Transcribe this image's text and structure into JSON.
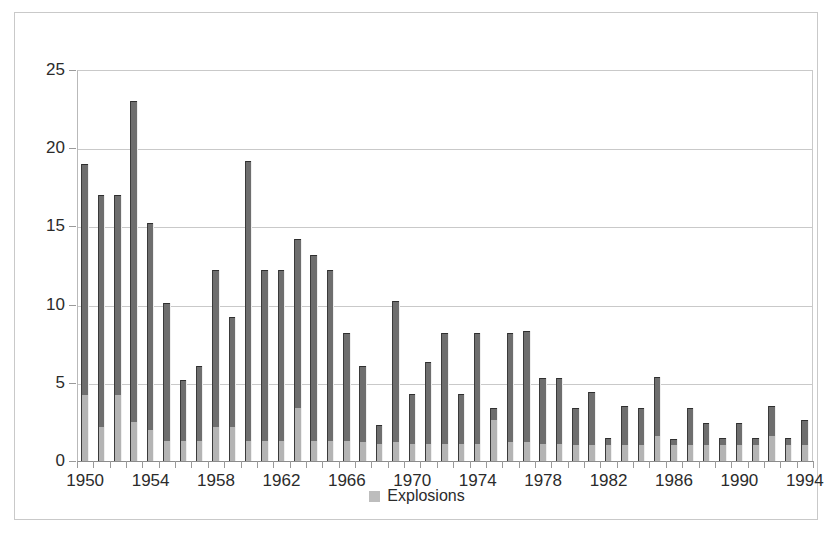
{
  "chart_data": {
    "type": "bar",
    "title": "",
    "xlabel": "",
    "ylabel": "",
    "ylim": [
      0,
      25
    ],
    "ytick_values": [
      0,
      5,
      10,
      15,
      20,
      25
    ],
    "ytick_labels": [
      "0",
      "5",
      "10",
      "15",
      "20",
      "25"
    ],
    "grid": true,
    "legend_position": "bottom",
    "legend": [
      {
        "name": "Explosions",
        "color": "#bdbdbd"
      }
    ],
    "series_colors": {
      "base_segment": "#b4b4b4",
      "upper_segment": "#6e6e6e"
    },
    "categories": [
      "1950",
      "1951",
      "1952",
      "1953",
      "1954",
      "1955",
      "1956",
      "1957",
      "1958",
      "1959",
      "1960",
      "1961",
      "1962",
      "1963",
      "1964",
      "1965",
      "1966",
      "1967",
      "1968",
      "1969",
      "1970",
      "1971",
      "1972",
      "1973",
      "1974",
      "1975",
      "1976",
      "1977",
      "1978",
      "1979",
      "1980",
      "1981",
      "1982",
      "1983",
      "1984",
      "1985",
      "1986",
      "1987",
      "1988",
      "1989",
      "1990",
      "1991",
      "1992",
      "1993",
      "1994"
    ],
    "xtick_labels": [
      "1950",
      "1954",
      "1958",
      "1962",
      "1966",
      "1970",
      "1974",
      "1978",
      "1982",
      "1986",
      "1990",
      "1994"
    ],
    "values": [
      19.0,
      17.0,
      17.0,
      23.0,
      15.2,
      10.1,
      5.2,
      6.1,
      12.2,
      9.2,
      19.2,
      12.2,
      12.2,
      14.2,
      13.2,
      12.2,
      8.2,
      6.1,
      2.3,
      10.2,
      4.3,
      6.3,
      8.2,
      4.3,
      8.2,
      3.4,
      8.2,
      8.3,
      5.3,
      5.3,
      3.4,
      4.4,
      1.5,
      3.5,
      3.4,
      5.4,
      1.4,
      3.4,
      2.4,
      1.5,
      2.4,
      1.5,
      3.5,
      1.5,
      2.6
    ],
    "base_values": [
      4.2,
      2.2,
      4.2,
      2.5,
      2.0,
      1.3,
      1.3,
      1.3,
      2.2,
      2.2,
      1.3,
      1.3,
      1.3,
      3.4,
      1.3,
      1.3,
      1.3,
      1.2,
      1.1,
      1.2,
      1.1,
      1.1,
      1.1,
      1.1,
      1.1,
      2.6,
      1.2,
      1.2,
      1.1,
      1.1,
      1.0,
      1.0,
      1.0,
      1.0,
      1.0,
      1.6,
      1.0,
      1.0,
      1.0,
      1.0,
      1.0,
      1.0,
      1.6,
      1.0,
      1.0
    ]
  },
  "legend": {
    "label": "Explosions"
  }
}
